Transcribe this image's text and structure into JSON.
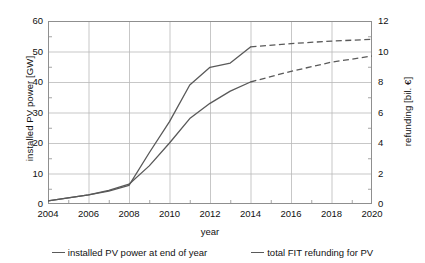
{
  "chart_data": {
    "type": "line",
    "title": "",
    "xlabel": "year",
    "ylabel": "installed PV power [GW]",
    "ylabel_right": "refunding [bil. €]",
    "x": [
      2004,
      2005,
      2006,
      2007,
      2008,
      2009,
      2010,
      2011,
      2012,
      2013,
      2014,
      2016,
      2018,
      2020
    ],
    "xlim": [
      2004,
      2020
    ],
    "xticks": [
      "2004",
      "2006",
      "2008",
      "2010",
      "2012",
      "2014",
      "2016",
      "2018",
      "2020"
    ],
    "xtick_values": [
      2004,
      2006,
      2008,
      2010,
      2012,
      2014,
      2016,
      2018,
      2020
    ],
    "ylim": [
      0,
      60
    ],
    "yticks": [
      "0",
      "10",
      "20",
      "30",
      "40",
      "50",
      "60"
    ],
    "ytick_values": [
      0,
      10,
      20,
      30,
      40,
      50,
      60
    ],
    "ylim_right": [
      0,
      12
    ],
    "yticks_right": [
      "0",
      "2",
      "4",
      "6",
      "8",
      "10",
      "12"
    ],
    "ytick_values_right": [
      0,
      2,
      4,
      6,
      8,
      10,
      12
    ],
    "grid": true,
    "legend_position": "bottom",
    "forecast_start_year": 2014,
    "series": [
      {
        "name": "installed PV power at end of year",
        "axis": "left",
        "unit": "GW",
        "color": "#595959",
        "values": [
          1.0,
          2.0,
          3.0,
          4.2,
          6.1,
          16.8,
          27.0,
          39.0,
          44.8,
          46.2,
          51.5,
          52.6,
          53.4,
          54.0
        ]
      },
      {
        "name": "total FIT refunding for PV",
        "axis": "right",
        "unit": "bil. €",
        "color": "#595959",
        "values": [
          0.2,
          0.4,
          0.6,
          0.9,
          1.3,
          2.5,
          4.0,
          5.6,
          6.6,
          7.4,
          8.0,
          8.7,
          9.3,
          9.7
        ]
      }
    ]
  },
  "legend": {
    "entries": [
      {
        "label": "installed PV power at end of year"
      },
      {
        "label": "total FIT refunding for PV"
      }
    ]
  }
}
